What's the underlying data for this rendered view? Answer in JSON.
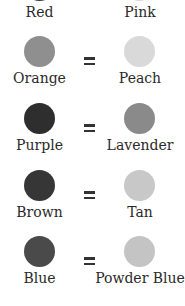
{
  "pairs": [
    {
      "left": {
        "label": "Red",
        "color": "#3a3a3a"
      },
      "right": {
        "label": "Pink",
        "color": "#d8d8d8"
      },
      "equals": "="
    },
    {
      "left": {
        "label": "Orange",
        "color": "#8f8f8f"
      },
      "right": {
        "label": "Peach",
        "color": "#d9d9d9"
      },
      "equals": "="
    },
    {
      "left": {
        "label": "Purple",
        "color": "#2e2e2e"
      },
      "right": {
        "label": "Lavender",
        "color": "#8a8a8a"
      },
      "equals": "="
    },
    {
      "left": {
        "label": "Brown",
        "color": "#363636"
      },
      "right": {
        "label": "Tan",
        "color": "#c8c8c8"
      },
      "equals": "="
    },
    {
      "left": {
        "label": "Blue",
        "color": "#4a4a4a"
      },
      "right": {
        "label": "Powder Blue",
        "color": "#c4c4c4"
      },
      "equals": "="
    }
  ]
}
